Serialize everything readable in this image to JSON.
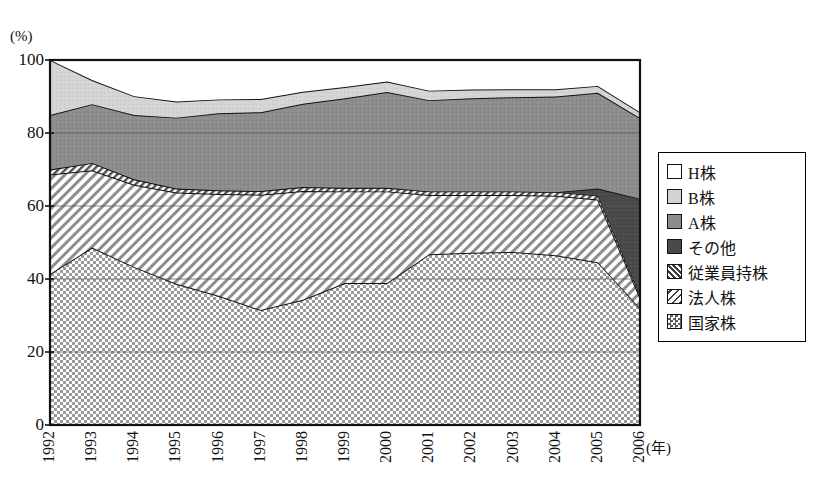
{
  "chart_data": {
    "type": "area",
    "title": "",
    "subtitle": "",
    "xlabel": "(年)",
    "ylabel": "(%)",
    "ylim": [
      0,
      100
    ],
    "yticks": [
      "0",
      "20",
      "40",
      "60",
      "80",
      "100"
    ],
    "ytick_values": [
      0,
      20,
      40,
      60,
      80,
      100
    ],
    "grid": true,
    "grid_lines": [
      20,
      40,
      60,
      80
    ],
    "legend_position": "right",
    "stacked": true,
    "stack_order_bottom_to_top": [
      "国家株",
      "法人株",
      "従業員持株",
      "その他",
      "A株",
      "B株",
      "H株"
    ],
    "categories": [
      "1992",
      "1993",
      "1994",
      "1995",
      "1996",
      "1997",
      "1998",
      "1999",
      "2000",
      "2001",
      "2002",
      "2003",
      "2004",
      "2005",
      "2006"
    ],
    "x": [
      1992,
      1993,
      1994,
      1995,
      1996,
      1997,
      1998,
      1999,
      2000,
      2001,
      2002,
      2003,
      2004,
      2005,
      2006
    ],
    "series": [
      {
        "name": "国家株",
        "pattern": "checker",
        "color": "#b4b4b4",
        "values": [
          41.4,
          48.6,
          43.3,
          38.7,
          35.4,
          31.5,
          34.3,
          38.9,
          38.9,
          46.8,
          47.2,
          47.4,
          46.5,
          44.6,
          32.0
        ]
      },
      {
        "name": "法人株",
        "pattern": "diagonal-hatch-light",
        "color": "#ffffff",
        "values": [
          27.2,
          21.2,
          22.5,
          25.0,
          27.9,
          31.6,
          29.8,
          25.1,
          25.1,
          16.2,
          15.8,
          15.6,
          16.3,
          17.2,
          3.0
        ]
      },
      {
        "name": "従業員持株",
        "pattern": "diagonal-hatch-dense",
        "color": "#e8e8e8",
        "values": [
          1.4,
          2.0,
          1.5,
          1.1,
          1.0,
          1.0,
          1.1,
          1.0,
          1.0,
          1.0,
          1.0,
          1.0,
          1.0,
          1.0,
          0.6
        ]
      },
      {
        "name": "その他",
        "pattern": "solid-dark",
        "color": "#4a4a4a",
        "values": [
          0.0,
          0.0,
          0.0,
          0.0,
          0.0,
          0.0,
          0.0,
          0.0,
          0.0,
          0.0,
          0.0,
          0.0,
          0.0,
          2.0,
          26.4
        ]
      },
      {
        "name": "A株",
        "pattern": "solid-mid",
        "color": "#8a8a8a",
        "values": [
          14.9,
          16.1,
          17.6,
          19.4,
          21.1,
          21.6,
          22.8,
          24.5,
          26.2,
          25.0,
          25.5,
          25.8,
          26.2,
          26.2,
          22.1
        ]
      },
      {
        "name": "B株",
        "pattern": "solid-light",
        "color": "#d6d6d6",
        "values": [
          15.1,
          6.6,
          5.2,
          4.4,
          3.8,
          3.6,
          3.3,
          3.1,
          2.9,
          2.6,
          2.4,
          2.2,
          2.0,
          1.9,
          1.6
        ]
      },
      {
        "name": "H株",
        "pattern": "white",
        "color": "#ffffff",
        "values": [
          0.0,
          5.5,
          9.9,
          11.4,
          10.8,
          10.7,
          8.7,
          7.4,
          5.9,
          8.4,
          8.1,
          8.0,
          8.0,
          7.1,
          14.3
        ]
      }
    ],
    "cumulative_top_percent": [
      100.0,
      94.5,
      94.7,
      93.4,
      92.5,
      92.3,
      92.3,
      92.8,
      92.7,
      91.8,
      91.9,
      92.0,
      92.0,
      92.9,
      85.7
    ]
  },
  "legend": {
    "items": [
      {
        "label": "H株",
        "swatch": "white"
      },
      {
        "label": "B株",
        "swatch": "solid-light"
      },
      {
        "label": "A株",
        "swatch": "solid-mid"
      },
      {
        "label": "その他",
        "swatch": "solid-dark"
      },
      {
        "label": "従業員持株",
        "swatch": "diagonal-hatch-dense"
      },
      {
        "label": "法人株",
        "swatch": "diagonal-hatch-light"
      },
      {
        "label": "国家株",
        "swatch": "checker"
      }
    ]
  },
  "axes": {
    "y_unit": "(%)",
    "x_unit": "(年)",
    "yticks": [
      "100",
      "80",
      "60",
      "40",
      "20",
      "0"
    ],
    "xticks": [
      "1992",
      "1993",
      "1994",
      "1995",
      "1996",
      "1997",
      "1998",
      "1999",
      "2000",
      "2001",
      "2002",
      "2003",
      "2004",
      "2005",
      "2006"
    ]
  },
  "colors": {
    "axis": "#111111",
    "grid": "#555555",
    "a_share": "#8a8a8a",
    "b_share": "#d6d6d6",
    "other": "#4a4a4a",
    "state": "#b4b4b4",
    "background": "#ffffff"
  }
}
